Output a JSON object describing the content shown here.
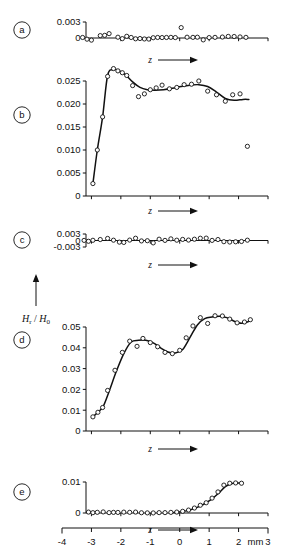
{
  "figure": {
    "ylabel": "H",
    "ylabel_sub": "r",
    "ylabel_sep": " / ",
    "ylabel2": "H",
    "ylabel2_sub": "0",
    "xlabel_symbol": "z",
    "x_unit": "mm",
    "panels": [
      "a",
      "b",
      "c",
      "d",
      "e"
    ]
  },
  "chart_data": [
    {
      "type": "scatter",
      "panel": "a",
      "title": "",
      "xlabel": "z",
      "ylabel": "Hr / H0",
      "xlim": [
        -4,
        3
      ],
      "ylim": [
        0,
        0.003
      ],
      "yticks": [
        0,
        0.003
      ],
      "ytick_labels": [
        "0",
        "0.003"
      ],
      "xticks": [
        -4,
        -3,
        -2,
        -1,
        0,
        1,
        2,
        3
      ],
      "grid": false,
      "legend": null,
      "has_curve": false,
      "x": [
        -3.3,
        -3.15,
        -3.0,
        -2.7,
        -2.55,
        -2.4,
        -2.1,
        -1.95,
        -1.8,
        -1.65,
        -1.5,
        -1.35,
        -1.2,
        -1.05,
        -0.9,
        -0.75,
        -0.6,
        -0.45,
        -0.3,
        -0.15,
        0.05,
        0.25,
        0.45,
        0.6,
        0.8,
        1.0,
        1.2,
        1.45,
        1.65,
        1.85,
        2.05,
        2.25
      ],
      "y": [
        0.0001,
        -0.00022,
        -0.0004,
        0.00045,
        0.0005,
        0.00082,
        0.00015,
        -0.00012,
        0.00032,
        0.0001,
        -0.00015,
        -0.0001,
        -0.00018,
        -0.0002,
        5e-05,
        0.0001,
        8e-05,
        0.0001,
        0.00012,
        8e-05,
        0.00195,
        0.00015,
        0.00012,
        0.00015,
        -0.00035,
        8e-05,
        0.00012,
        0.00018,
        0.0003,
        0.00028,
        0.0002,
        0.00012
      ]
    },
    {
      "type": "line",
      "panel": "b",
      "title": "",
      "xlabel": "z",
      "ylabel": "Hr / H0",
      "xlim": [
        -4,
        3
      ],
      "ylim": [
        0,
        0.028
      ],
      "yticks": [
        0,
        0.005,
        0.01,
        0.015,
        0.02,
        0.025
      ],
      "ytick_labels": [
        "0",
        "0.005",
        "0.010",
        "0.015",
        "0.020",
        "0.025"
      ],
      "xticks": [
        -4,
        -3,
        -2,
        -1,
        0,
        1,
        2,
        3
      ],
      "grid": false,
      "legend": null,
      "has_curve": true,
      "x": [
        -2.95,
        -2.8,
        -2.62,
        -2.45,
        -2.25,
        -2.1,
        -1.95,
        -1.8,
        -1.6,
        -1.4,
        -1.2,
        -1.0,
        -0.8,
        -0.6,
        -0.35,
        -0.1,
        0.15,
        0.4,
        0.65,
        0.95,
        1.25,
        1.55,
        1.8,
        2.05,
        2.3
      ],
      "y": [
        0.0027,
        0.01,
        0.0172,
        0.026,
        0.0277,
        0.0272,
        0.0268,
        0.0262,
        0.024,
        0.0216,
        0.0222,
        0.0231,
        0.0235,
        0.0241,
        0.0233,
        0.0236,
        0.0242,
        0.0243,
        0.025,
        0.0228,
        0.022,
        0.0206,
        0.022,
        0.0222,
        0.0108
      ],
      "curve_x": [
        -2.95,
        -2.8,
        -2.62,
        -2.45,
        -2.25,
        -2.05,
        -1.85,
        -1.6,
        -1.35,
        -1.1,
        -0.85,
        -0.55,
        -0.25,
        0.05,
        0.35,
        0.65,
        0.95,
        1.25,
        1.55,
        1.85,
        2.15,
        2.35
      ],
      "curve_y": [
        0.0027,
        0.01,
        0.0172,
        0.0262,
        0.0275,
        0.0272,
        0.0264,
        0.0248,
        0.0236,
        0.0231,
        0.023,
        0.0231,
        0.0234,
        0.0238,
        0.0241,
        0.0242,
        0.0238,
        0.0226,
        0.0212,
        0.0208,
        0.021,
        0.021
      ]
    },
    {
      "type": "scatter",
      "panel": "c",
      "title": "",
      "xlabel": "z",
      "ylabel": "Hr / H0",
      "xlim": [
        -4,
        3
      ],
      "ylim": [
        -0.003,
        0.003
      ],
      "yticks": [
        -0.003,
        0,
        0.003
      ],
      "ytick_labels": [
        "-0.003",
        "0",
        "0.003"
      ],
      "xticks": [
        -4,
        -3,
        -2,
        -1,
        0,
        1,
        2,
        3
      ],
      "grid": false,
      "legend": null,
      "has_curve": false,
      "x": [
        -3.25,
        -3.1,
        -2.95,
        -2.7,
        -2.45,
        -2.25,
        -2.05,
        -1.9,
        -1.7,
        -1.5,
        -1.3,
        -1.1,
        -0.9,
        -0.7,
        -0.5,
        -0.3,
        -0.1,
        0.1,
        0.3,
        0.5,
        0.7,
        0.9,
        1.1,
        1.3,
        1.5,
        1.7,
        1.9,
        2.1,
        2.3
      ],
      "y": [
        5e-05,
        -0.00035,
        0.0001,
        0.00045,
        0.00095,
        0.00015,
        -0.00075,
        -0.0009,
        0.0002,
        0.00105,
        -0.0002,
        -0.0001,
        -0.0011,
        0.0006,
        5e-05,
        0.00075,
        0.00015,
        0.0005,
        0.0002,
        0.0006,
        0.00105,
        0.0011,
        5e-05,
        0.00045,
        -0.00055,
        -0.0007,
        -0.0006,
        -0.00045,
        0.00015
      ]
    },
    {
      "type": "line",
      "panel": "d",
      "title": "",
      "xlabel": "z",
      "ylabel": "Hr / H0",
      "xlim": [
        -4,
        3
      ],
      "ylim": [
        0,
        0.058
      ],
      "yticks": [
        0,
        0.01,
        0.02,
        0.03,
        0.04,
        0.05
      ],
      "ytick_labels": [
        "0",
        "0.01",
        "0.02",
        "0.03",
        "0.04",
        "0.05"
      ],
      "xticks": [
        -4,
        -3,
        -2,
        -1,
        0,
        1,
        2,
        3
      ],
      "grid": false,
      "legend": null,
      "has_curve": true,
      "x": [
        -2.95,
        -2.78,
        -2.62,
        -2.45,
        -2.2,
        -1.95,
        -1.7,
        -1.45,
        -1.25,
        -1.0,
        -0.75,
        -0.5,
        -0.25,
        0.0,
        0.22,
        0.45,
        0.7,
        0.95,
        1.2,
        1.45,
        1.7,
        1.95,
        2.2,
        2.4
      ],
      "y": [
        0.0068,
        0.009,
        0.0113,
        0.0195,
        0.0292,
        0.0378,
        0.0432,
        0.0407,
        0.0445,
        0.0425,
        0.0405,
        0.0378,
        0.0372,
        0.0388,
        0.0448,
        0.0505,
        0.0545,
        0.0517,
        0.0554,
        0.0553,
        0.0538,
        0.052,
        0.0524,
        0.0535
      ],
      "curve_x": [
        -2.95,
        -2.78,
        -2.6,
        -2.4,
        -2.15,
        -1.9,
        -1.65,
        -1.4,
        -1.15,
        -0.9,
        -0.65,
        -0.4,
        -0.15,
        0.1,
        0.35,
        0.6,
        0.85,
        1.1,
        1.35,
        1.6,
        1.85,
        2.1,
        2.3,
        2.45
      ],
      "curve_y": [
        0.0068,
        0.009,
        0.0118,
        0.019,
        0.0288,
        0.0372,
        0.0428,
        0.0436,
        0.0436,
        0.0424,
        0.04,
        0.038,
        0.0375,
        0.0392,
        0.045,
        0.051,
        0.054,
        0.0548,
        0.0552,
        0.0545,
        0.0528,
        0.0518,
        0.0524,
        0.0536
      ]
    },
    {
      "type": "line",
      "panel": "e",
      "title": "",
      "xlabel": "z",
      "ylabel": "Hr / H0",
      "xlim": [
        -4,
        3
      ],
      "ylim": [
        0,
        0.012
      ],
      "yticks": [
        0,
        0.01
      ],
      "ytick_labels": [
        "0",
        "0.01"
      ],
      "xticks": [
        -4,
        -3,
        -2,
        -1,
        0,
        1,
        2,
        3
      ],
      "grid": false,
      "legend": null,
      "has_curve": true,
      "x": [
        -3.1,
        -2.95,
        -2.8,
        -2.6,
        -2.4,
        -2.25,
        -2.1,
        -1.9,
        -1.7,
        -1.5,
        -1.3,
        -1.1,
        -0.9,
        -0.7,
        -0.5,
        -0.3,
        -0.1,
        0.1,
        0.3,
        0.5,
        0.7,
        0.9,
        1.1,
        1.3,
        1.5,
        1.7,
        1.9,
        2.1
      ],
      "y": [
        0.0003,
        0.0001,
        0.00022,
        0.00035,
        0.00012,
        0.0002,
        0.00018,
        0.00028,
        0.00022,
        0.0003,
        8e-05,
        4e-05,
        2e-05,
        0.00012,
        0.00012,
        0.0002,
        0.0003,
        0.00055,
        0.00095,
        0.0016,
        0.0025,
        0.0033,
        0.0048,
        0.0068,
        0.009,
        0.0096,
        0.0097,
        0.0096
      ],
      "curve_x": [
        -0.2,
        0.05,
        0.3,
        0.55,
        0.8,
        1.05,
        1.3,
        1.55,
        1.75,
        1.95,
        2.15
      ],
      "curve_y": [
        0.0002,
        0.00038,
        0.00085,
        0.00165,
        0.00275,
        0.0042,
        0.0062,
        0.0085,
        0.00945,
        0.00965,
        0.0096
      ]
    }
  ],
  "x_axis_strip": {
    "ticks": [
      {
        "value": -4,
        "label": "-4"
      },
      {
        "value": -3,
        "label": "-3"
      },
      {
        "value": -2,
        "label": "-2"
      },
      {
        "value": -1,
        "label": "-1"
      },
      {
        "value": 0,
        "label": "0"
      },
      {
        "value": 1,
        "label": "1"
      },
      {
        "value": 2,
        "label": "2"
      },
      {
        "value": 3,
        "label": "3"
      }
    ],
    "unit": "mm"
  }
}
